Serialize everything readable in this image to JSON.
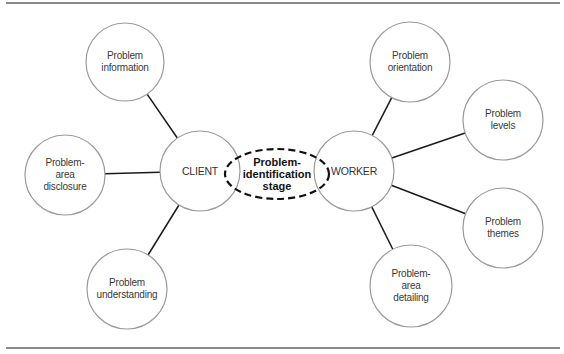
{
  "diagram": {
    "center": {
      "label": "Problem-\nidentification\nstage",
      "x": 277,
      "y": 174,
      "rx": 52,
      "ry": 25
    },
    "hubs": [
      {
        "id": "client",
        "label": "CLIENT",
        "x": 200,
        "y": 171,
        "r": 40
      },
      {
        "id": "worker",
        "label": "WORKER",
        "x": 354,
        "y": 171,
        "r": 40
      }
    ],
    "nodes": [
      {
        "id": "problem-information",
        "label": "Problem\ninformation",
        "x": 125,
        "y": 62,
        "r": 39,
        "hub": "client"
      },
      {
        "id": "problem-area-disclosure",
        "label": "Problem-\narea\ndisclosure",
        "x": 65,
        "y": 175,
        "r": 40,
        "hub": "client"
      },
      {
        "id": "problem-understanding",
        "label": "Problem\nunderstanding",
        "x": 127,
        "y": 289,
        "r": 40,
        "hub": "client"
      },
      {
        "id": "problem-orientation",
        "label": "Problem\norientation",
        "x": 410,
        "y": 62,
        "r": 40,
        "hub": "worker"
      },
      {
        "id": "problem-levels",
        "label": "Problem\nlevels",
        "x": 503,
        "y": 120,
        "r": 40,
        "hub": "worker"
      },
      {
        "id": "problem-themes",
        "label": "Problem\nthemes",
        "x": 503,
        "y": 228,
        "r": 40,
        "hub": "worker"
      },
      {
        "id": "problem-area-detailing",
        "label": "Problem-\narea\ndetailing",
        "x": 411,
        "y": 286,
        "r": 41,
        "hub": "worker"
      }
    ],
    "colors": {
      "circle_stroke": "#9a9a9a",
      "connector": "#1a1a1a",
      "dashed": "#111111",
      "rule": "#8a8a8a"
    }
  }
}
